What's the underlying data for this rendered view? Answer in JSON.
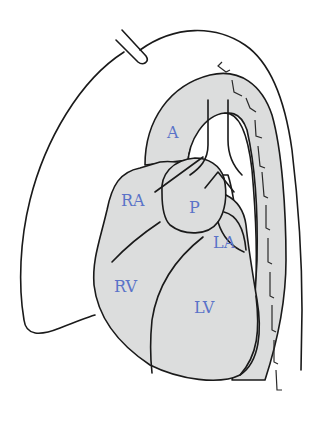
{
  "diagram": {
    "type": "anatomical-illustration",
    "colors": {
      "background": "#ffffff",
      "organ_fill": "#dcdddd",
      "outline": "#1a1a1a",
      "label": "#5a73c8"
    },
    "labels": {
      "aorta": "A",
      "right_atrium": "RA",
      "pulmonary": "P",
      "left_atrium": "LA",
      "right_ventricle": "RV",
      "left_ventricle": "LV"
    }
  }
}
